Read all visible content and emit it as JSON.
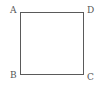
{
  "diagram": {
    "shape": "square",
    "vertices": [
      {
        "label": "A",
        "position": "top-left"
      },
      {
        "label": "D",
        "position": "top-right"
      },
      {
        "label": "B",
        "position": "bottom-left"
      },
      {
        "label": "C",
        "position": "bottom-right"
      }
    ],
    "stroke_color": "#5a5a5a",
    "label_color": "#555555"
  }
}
